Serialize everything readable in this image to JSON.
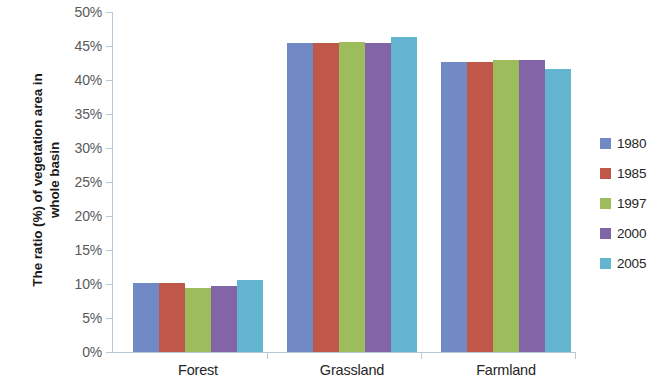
{
  "chart_data": {
    "type": "bar",
    "title": "",
    "xlabel": "",
    "ylabel": "The ratio (%) of vegetation area in whole basin",
    "ylabel_line1": "The ratio (%) of vegetation area in",
    "ylabel_line2": "whole basin",
    "categories": [
      "Forest",
      "Grassland",
      "Farmland"
    ],
    "series": [
      {
        "name": "1980",
        "color": "#7189c4",
        "values": [
          10.1,
          45.5,
          42.6
        ]
      },
      {
        "name": "1985",
        "color": "#c0584a",
        "values": [
          10.1,
          45.4,
          42.6
        ]
      },
      {
        "name": "1997",
        "color": "#9dbd5c",
        "values": [
          9.4,
          45.6,
          43.0
        ]
      },
      {
        "name": "2000",
        "color": "#8165a6",
        "values": [
          9.7,
          45.4,
          43.0
        ]
      },
      {
        "name": "2005",
        "color": "#62b4cf",
        "values": [
          10.6,
          46.3,
          41.6
        ]
      }
    ],
    "ylim": [
      0,
      50
    ],
    "ytick_labels": [
      "50%",
      "45%",
      "40%",
      "35%",
      "30%",
      "25%",
      "20%",
      "15%",
      "10%",
      "5%",
      "0%"
    ],
    "ytick_values": [
      50,
      45,
      40,
      35,
      30,
      25,
      20,
      15,
      10,
      5,
      0
    ],
    "ytick_interval": 5,
    "grid": false,
    "legend_position": "right",
    "legend_entries": [
      "1980",
      "1985",
      "1997",
      "2000",
      "2005"
    ],
    "axis_color": "#b8c8d8",
    "background": "#ffffff"
  }
}
